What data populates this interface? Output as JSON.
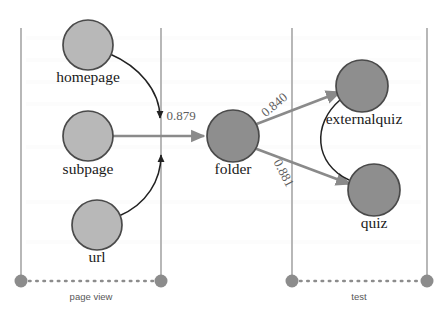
{
  "canvas": {
    "width": 448,
    "height": 315,
    "background": "#ffffff"
  },
  "palette": {
    "node_fill_light": "#b8b8b8",
    "node_fill_dark": "#8e8e8e",
    "node_stroke": "#4a4a4a",
    "lane_line": "#a6a6a6",
    "lane_dot": "#8c8c8c",
    "edge_gray": "#8a8a8a",
    "edge_black": "#222222",
    "label_text": "#1a1a1a",
    "weight_text": "#5d5d5d",
    "lane_text": "#585858"
  },
  "graph": {
    "type": "directed-graph",
    "nodes": [
      {
        "id": "homepage",
        "label": "homepage",
        "cx": 88,
        "cy": 45,
        "r": 25,
        "shade": "light",
        "label_x": 88,
        "label_y": 82
      },
      {
        "id": "subpage",
        "label": "subpage",
        "cx": 88,
        "cy": 136,
        "r": 25,
        "shade": "light",
        "label_x": 88,
        "label_y": 174
      },
      {
        "id": "url",
        "label": "url",
        "cx": 97,
        "cy": 225,
        "r": 25,
        "shade": "light",
        "label_x": 97,
        "label_y": 262
      },
      {
        "id": "folder",
        "label": "folder",
        "cx": 233,
        "cy": 136,
        "r": 26,
        "shade": "dark",
        "label_x": 233,
        "label_y": 174
      },
      {
        "id": "externalquiz",
        "label": "externalquiz",
        "cx": 362,
        "cy": 86,
        "r": 26,
        "shade": "dark",
        "label_x": 364,
        "label_y": 124
      },
      {
        "id": "quiz",
        "label": "quiz",
        "cx": 374,
        "cy": 190,
        "r": 26,
        "shade": "dark",
        "label_x": 374,
        "label_y": 228
      }
    ],
    "edges": [
      {
        "id": "homepage-junction",
        "from": "homepage",
        "to": "junction",
        "style": "curve-black",
        "weight": null,
        "arrow": "down"
      },
      {
        "id": "url-junction",
        "from": "url",
        "to": "junction",
        "style": "curve-black",
        "weight": null,
        "arrow": "up"
      },
      {
        "id": "subpage-folder",
        "from": "subpage",
        "to": "folder",
        "style": "straight",
        "weight": "0.879",
        "weight_x": 181,
        "weight_y": 120,
        "weight_rotate": 0
      },
      {
        "id": "folder-externalquiz",
        "from": "folder",
        "to": "externalquiz",
        "style": "straight",
        "weight": "0.840",
        "weight_x": 277,
        "weight_y": 108,
        "weight_rotate": -40
      },
      {
        "id": "folder-quiz",
        "from": "folder",
        "to": "quiz",
        "style": "straight",
        "weight": "0.881",
        "weight_x": 280,
        "weight_y": 175,
        "weight_rotate": 62
      },
      {
        "id": "externalquiz-quiz",
        "from": "externalquiz",
        "to": "quiz",
        "style": "curve-black",
        "weight": null,
        "arrow": "none"
      }
    ],
    "lanes": [
      {
        "id": "page-view",
        "label": "page view",
        "x_start": 21,
        "x_end": 161,
        "line_top": 28,
        "line_bottom": 281,
        "label_x": 91,
        "label_y": 300
      },
      {
        "id": "test",
        "label": "test",
        "x_start": 292,
        "x_end": 427,
        "line_top": 28,
        "line_bottom": 281,
        "label_x": 359,
        "label_y": 300
      }
    ],
    "junction": {
      "x": 161,
      "y": 136
    }
  },
  "ghost_rows": [
    {
      "x": 30,
      "y": 40,
      "text": ""
    },
    {
      "x": 200,
      "y": 62,
      "text": ""
    }
  ]
}
